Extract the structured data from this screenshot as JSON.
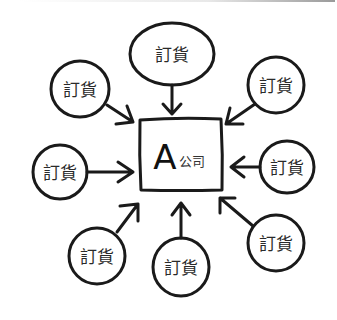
{
  "diagram": {
    "type": "hub-and-spoke",
    "center": {
      "letter": "A",
      "label": "公司"
    },
    "nodes": [
      {
        "id": "top",
        "label": "訂貨"
      },
      {
        "id": "upper-left",
        "label": "訂貨"
      },
      {
        "id": "upper-right",
        "label": "訂貨"
      },
      {
        "id": "left",
        "label": "訂貨"
      },
      {
        "id": "right",
        "label": "訂貨"
      },
      {
        "id": "lower-left",
        "label": "訂貨"
      },
      {
        "id": "bottom",
        "label": "訂貨"
      },
      {
        "id": "lower-right",
        "label": "訂貨"
      }
    ],
    "arrow_direction": "nodes-to-center",
    "colors": {
      "ink": "#1a1a1a",
      "background": "#ffffff"
    }
  }
}
